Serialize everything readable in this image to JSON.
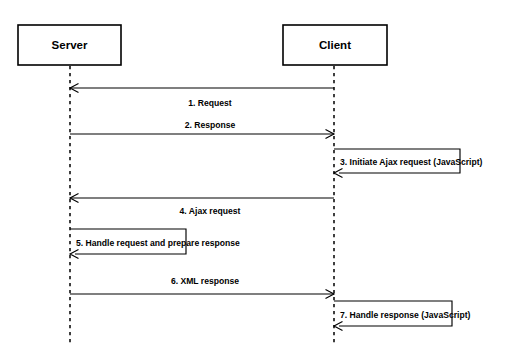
{
  "diagram": {
    "type": "sequence-diagram",
    "title": "",
    "participants": [
      {
        "id": "server",
        "label": "Server",
        "x": 70,
        "box": {
          "x": 18,
          "y": 25,
          "w": 103,
          "h": 40
        }
      },
      {
        "id": "client",
        "label": "Client",
        "x": 334,
        "box": {
          "x": 283,
          "y": 25,
          "w": 104,
          "h": 40
        }
      }
    ],
    "lifeline": {
      "top": 66,
      "bottom": 346
    },
    "messages": [
      {
        "number": "1",
        "label": "1. Request",
        "text": "Request",
        "from": "client",
        "to": "server",
        "kind": "call",
        "direction": "left",
        "y": 88,
        "label_x": 210,
        "label_y": 104
      },
      {
        "number": "2",
        "label": "2. Response",
        "text": "Response",
        "from": "server",
        "to": "client",
        "kind": "call",
        "direction": "right",
        "y": 134,
        "label_x": 210,
        "label_y": 126
      },
      {
        "number": "3",
        "label": "3. Initiate Ajax request (JavaScript)",
        "text": "Initiate Ajax request (JavaScript)",
        "from": "client",
        "to": "client",
        "kind": "self",
        "direction": "self",
        "y": 149,
        "y_return": 173,
        "extent": 460,
        "label_x": 340,
        "label_y": 163
      },
      {
        "number": "4",
        "label": "4. Ajax request",
        "text": "Ajax request",
        "from": "client",
        "to": "server",
        "kind": "call",
        "direction": "left",
        "y": 198,
        "label_x": 210,
        "label_y": 212
      },
      {
        "number": "5",
        "label": "5. Handle request and prepare response",
        "text": "Handle request and prepare response",
        "from": "server",
        "to": "server",
        "kind": "self",
        "direction": "self",
        "y": 229,
        "y_return": 254,
        "extent": 186,
        "label_x": 76,
        "label_y": 244
      },
      {
        "number": "6",
        "label": "6. XML response",
        "text": "XML response",
        "from": "server",
        "to": "client",
        "kind": "call",
        "direction": "right",
        "y": 294,
        "label_x": 205,
        "label_y": 282
      },
      {
        "number": "7",
        "label": "7. Handle response (JavaScript)",
        "text": "Handle response (JavaScript)",
        "from": "client",
        "to": "client",
        "kind": "self",
        "direction": "self",
        "y": 301,
        "y_return": 326,
        "extent": 452,
        "label_x": 340,
        "label_y": 316
      }
    ],
    "colors": {
      "background": "#ffffff",
      "stroke": "#000000",
      "text": "#000000"
    }
  }
}
